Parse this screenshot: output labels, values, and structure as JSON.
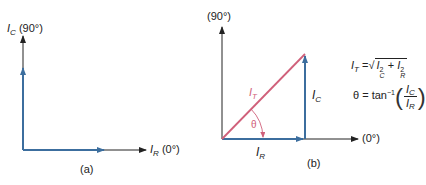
{
  "diagram_a": {
    "caption": "(a)",
    "y_axis": {
      "symbol": "I",
      "subscript": "C",
      "angle": "(90°)"
    },
    "x_axis": {
      "symbol": "I",
      "subscript": "R",
      "angle": "(0°)"
    },
    "vectors": [
      {
        "name": "I_C",
        "direction": "90°",
        "color": "#3c6e9e"
      },
      {
        "name": "I_R",
        "direction": "0°",
        "color": "#3c6e9e"
      }
    ]
  },
  "diagram_b": {
    "caption": "(b)",
    "y_axis_label": "(90°)",
    "x_axis_label": "(0°)",
    "vector_labels": {
      "resultant": {
        "symbol": "I",
        "subscript": "T",
        "color": "#d0607a"
      },
      "capacitive": {
        "symbol": "I",
        "subscript": "C"
      },
      "resistive": {
        "symbol": "I",
        "subscript": "R"
      },
      "angle": "θ"
    },
    "colors": {
      "component_vectors": "#3c6e9e",
      "resultant_vector": "#d0607a",
      "axes": "#222222"
    },
    "formulas": {
      "magnitude": {
        "lhs_symbol": "I",
        "lhs_sub": "T",
        "equals": "=",
        "sqrt_sign": "√",
        "term1_symbol": "I",
        "term1_sub": "C",
        "term1_exp": "2",
        "plus": "+",
        "term2_symbol": "I",
        "term2_sub": "R",
        "term2_exp": "2"
      },
      "angle": {
        "lhs": "θ",
        "equals": "=",
        "func": "tan",
        "exp": "−1",
        "open_paren": "(",
        "close_paren": ")",
        "num_symbol": "I",
        "num_sub": "C",
        "den_symbol": "I",
        "den_sub": "R"
      }
    }
  }
}
